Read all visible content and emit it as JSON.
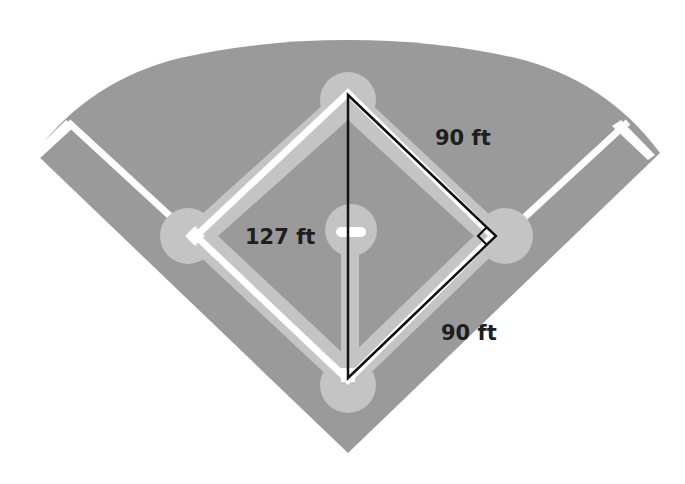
{
  "diagram": {
    "labels": {
      "side_top": "90 ft",
      "side_bottom": "90 ft",
      "hypotenuse": "127 ft"
    },
    "colors": {
      "background": "#ffffff",
      "outfield": "#9a9a9a",
      "foul_territory": "#9a9a9a",
      "base_paths": "#c4c4c4",
      "infield": "#9a9a9a",
      "lines": "#ffffff",
      "triangle": "#111111",
      "text": "#1e1e1e"
    },
    "points": {
      "home_plate": [
        348,
        380
      ],
      "first_base": [
        493,
        236
      ],
      "second_base": [
        348,
        93
      ],
      "third_base": [
        196,
        236
      ],
      "pitcher_mound": [
        348,
        236
      ]
    },
    "triangle": {
      "vertices": [
        "second_base",
        "first_base",
        "home_plate"
      ],
      "right_angle_at": "first_base"
    }
  }
}
